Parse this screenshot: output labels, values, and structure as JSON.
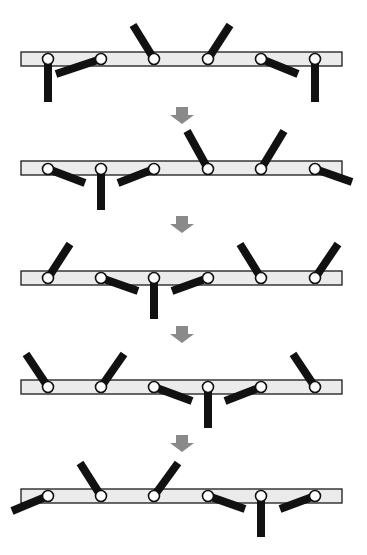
{
  "diagram": {
    "colors": {
      "bar_fill": "#ebebeb",
      "arm": "#111111",
      "joint_fill": "#ffffff",
      "arrow": "#8a8a8a"
    },
    "bar": {
      "x": 21,
      "width": 321,
      "height": 14
    },
    "joint_x": [
      48,
      101,
      154,
      208,
      261,
      315
    ],
    "joint_radius": 5.5,
    "stages": [
      {
        "index": 1,
        "bar_y": 52,
        "joint_y": 59,
        "arm_ends": [
          [
            48,
            102
          ],
          [
            56,
            74
          ],
          [
            133,
            25
          ],
          [
            230,
            25
          ],
          [
            298,
            74
          ],
          [
            315,
            102
          ]
        ],
        "arm_states": [
          "down",
          "down-left",
          "up-left",
          "up-right",
          "down-right",
          "down"
        ]
      },
      {
        "index": 2,
        "bar_y": 161,
        "joint_y": 169,
        "arm_ends": [
          [
            85,
            183
          ],
          [
            101,
            210
          ],
          [
            118,
            183
          ],
          [
            187,
            131
          ],
          [
            284,
            131
          ],
          [
            352,
            182
          ]
        ],
        "arm_states": [
          "down-right",
          "down",
          "down-left",
          "up-left",
          "up-right",
          "down-right"
        ]
      },
      {
        "index": 3,
        "bar_y": 271,
        "joint_y": 278,
        "arm_ends": [
          [
            70,
            244
          ],
          [
            138,
            291
          ],
          [
            154,
            319
          ],
          [
            172,
            291
          ],
          [
            240,
            244
          ],
          [
            338,
            244
          ]
        ],
        "arm_states": [
          "up-right",
          "down-right",
          "down",
          "down-left",
          "up-left",
          "up-right"
        ]
      },
      {
        "index": 4,
        "bar_y": 380,
        "joint_y": 387,
        "arm_ends": [
          [
            26,
            354
          ],
          [
            124,
            354
          ],
          [
            192,
            401
          ],
          [
            208,
            428
          ],
          [
            225,
            401
          ],
          [
            293,
            354
          ]
        ],
        "arm_states": [
          "up-left",
          "up-right",
          "down-right",
          "down",
          "down-left",
          "up-left"
        ]
      },
      {
        "index": 5,
        "bar_y": 489,
        "joint_y": 496,
        "arm_ends": [
          [
            12,
            511
          ],
          [
            80,
            463
          ],
          [
            178,
            463
          ],
          [
            245,
            509
          ],
          [
            261,
            537
          ],
          [
            280,
            509
          ]
        ],
        "arm_states": [
          "down-left",
          "up-left",
          "up-right",
          "down-right",
          "down",
          "down-left"
        ]
      }
    ],
    "arrows": [
      {
        "cx": 182,
        "top": 107
      },
      {
        "cx": 182,
        "top": 216
      },
      {
        "cx": 182,
        "top": 326
      },
      {
        "cx": 182,
        "top": 435
      }
    ],
    "arrow_icon": "down-arrow-icon"
  }
}
